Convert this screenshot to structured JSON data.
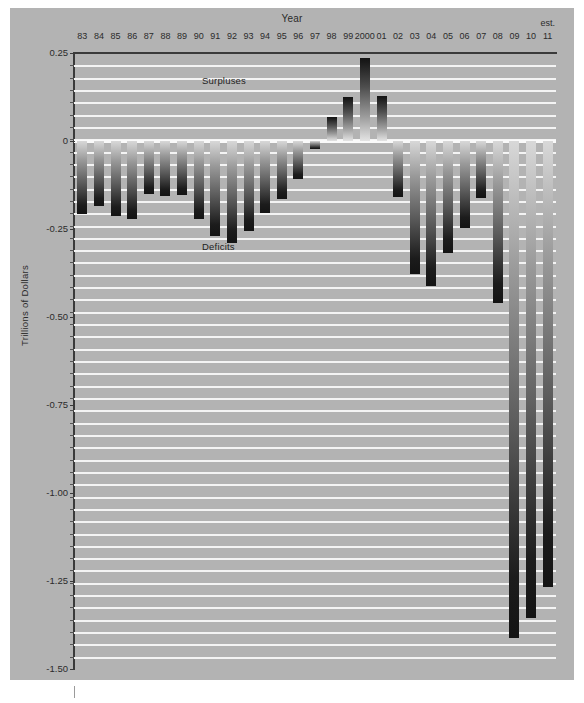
{
  "figure": {
    "axis_title_x": "Year",
    "axis_title_y": "Trillions of Dollars",
    "est_label": "est.",
    "annotation_surpluses": "Surpluses",
    "annotation_deficits": "Deficits",
    "background_color": "#b3b3b3",
    "gridline_color": "#f4f4f4",
    "bar_color_dark": "#141414",
    "bar_color_light": "#d8d8d8"
  },
  "chart_data": {
    "type": "bar",
    "title": "",
    "subtitle": "",
    "xlabel": "Year",
    "ylabel": "Trillions of Dollars",
    "ylim": [
      -1.5,
      0.25
    ],
    "yticks": [
      0.25,
      0,
      -0.25,
      -0.5,
      -0.75,
      -1.0,
      -1.25,
      -1.5
    ],
    "ytick_labels": [
      "0.25",
      "0",
      "-0.25",
      "-0.50",
      "-0.75",
      "-1.00",
      "-1.25",
      "-1.50"
    ],
    "minor_gridlines_step": 0.03571,
    "grid": true,
    "legend": "none",
    "annotations": [
      {
        "text": "Surpluses",
        "x": "1989",
        "y": 0.17
      },
      {
        "text": "Deficits",
        "x": "1989",
        "y": -0.3
      }
    ],
    "categories": [
      "83",
      "84",
      "85",
      "86",
      "87",
      "88",
      "89",
      "90",
      "91",
      "92",
      "93",
      "94",
      "95",
      "96",
      "97",
      "98",
      "99",
      "2000",
      "01",
      "02",
      "03",
      "04",
      "05",
      "06",
      "07",
      "08",
      "09",
      "10",
      "11"
    ],
    "values": [
      -0.208,
      -0.185,
      -0.212,
      -0.221,
      -0.15,
      -0.155,
      -0.153,
      -0.221,
      -0.269,
      -0.29,
      -0.255,
      -0.203,
      -0.164,
      -0.107,
      -0.022,
      0.069,
      0.126,
      0.236,
      0.128,
      -0.158,
      -0.378,
      -0.413,
      -0.318,
      -0.248,
      -0.161,
      -0.459,
      -1.413,
      -1.356,
      -1.267
    ],
    "value_unit": "trillions of dollars",
    "estimated_categories": [
      "11"
    ]
  }
}
